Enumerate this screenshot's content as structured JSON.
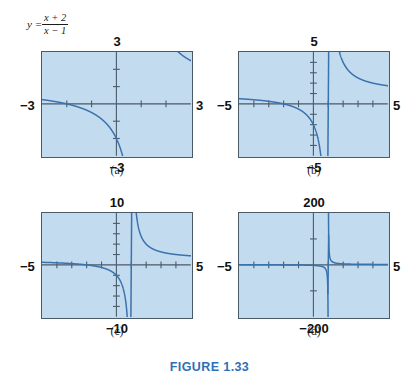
{
  "figure": {
    "caption": "FIGURE 1.33",
    "caption_color": "#2f6fb5",
    "formula": {
      "lhs": "y =",
      "numerator": "x + 2",
      "denominator": "x − 1"
    }
  },
  "style": {
    "plot_background": "#c3dbef",
    "plot_border": "#4a5a68",
    "curve_color": "#3a72ad",
    "axis_color": "#4a5a68",
    "label_color": "#111111"
  },
  "chart_data": [
    {
      "id": "a",
      "type": "line",
      "title": "",
      "panel_label": "(a)",
      "function": "y = (x + 2) / (x - 1)",
      "xlabel": "",
      "ylabel": "",
      "xlim": [
        -3,
        3
      ],
      "ylim": [
        -3,
        3
      ],
      "xticks": [
        -2,
        -1,
        1,
        2
      ],
      "yticks": [
        -2,
        -1,
        1,
        2
      ],
      "tick_labels": {
        "top": "3",
        "bottom": "−3",
        "left": "−3",
        "right": "3"
      },
      "asymptote_x": 1,
      "grid": false,
      "legend": "none"
    },
    {
      "id": "b",
      "type": "line",
      "title": "",
      "panel_label": "(b)",
      "function": "y = (x + 2) / (x - 1)",
      "xlabel": "",
      "ylabel": "",
      "xlim": [
        -5,
        5
      ],
      "ylim": [
        -5,
        5
      ],
      "xticks": [
        -4,
        -3,
        -2,
        -1,
        1,
        2,
        3,
        4
      ],
      "yticks": [
        -4,
        -3,
        -2,
        -1,
        1,
        2,
        3,
        4
      ],
      "tick_labels": {
        "top": "5",
        "bottom": "−5",
        "left": "−5",
        "right": "5"
      },
      "asymptote_x": 1,
      "grid": false,
      "legend": "none"
    },
    {
      "id": "c",
      "type": "line",
      "title": "",
      "panel_label": "(c)",
      "function": "y = (x + 2) / (x - 1)",
      "xlabel": "",
      "ylabel": "",
      "xlim": [
        -5,
        5
      ],
      "ylim": [
        -10,
        10
      ],
      "xticks": [
        -4,
        -3,
        -2,
        -1,
        1,
        2,
        3,
        4
      ],
      "yticks": [
        -8,
        -6,
        -4,
        -2,
        2,
        4,
        6,
        8
      ],
      "tick_labels": {
        "top": "10",
        "bottom": "−10",
        "left": "−5",
        "right": "5"
      },
      "asymptote_x": 1,
      "grid": false,
      "legend": "none"
    },
    {
      "id": "d",
      "type": "line",
      "title": "",
      "panel_label": "(d)",
      "function": "y = (x + 2) / (x - 1)",
      "xlabel": "",
      "ylabel": "",
      "xlim": [
        -5,
        5
      ],
      "ylim": [
        -200,
        200
      ],
      "xticks": [
        -4,
        -3,
        -2,
        -1,
        1,
        2,
        3,
        4
      ],
      "yticks": [
        -100,
        100
      ],
      "tick_labels": {
        "top": "200",
        "bottom": "−200",
        "left": "−5",
        "right": "5"
      },
      "asymptote_x": 1,
      "grid": false,
      "legend": "none"
    }
  ],
  "layout": {
    "panels": [
      {
        "id": "a",
        "box": {
          "left": 41,
          "top": 51,
          "width": 152,
          "height": 107
        },
        "caption_y": 164
      },
      {
        "id": "b",
        "box": {
          "left": 238,
          "top": 51,
          "width": 152,
          "height": 107
        },
        "caption_y": 164
      },
      {
        "id": "c",
        "box": {
          "left": 41,
          "top": 212,
          "width": 152,
          "height": 107
        },
        "caption_y": 325
      },
      {
        "id": "d",
        "box": {
          "left": 238,
          "top": 212,
          "width": 152,
          "height": 107
        },
        "caption_y": 325
      }
    ]
  }
}
